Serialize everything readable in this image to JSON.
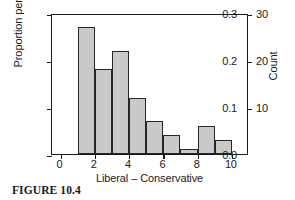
{
  "caption": "FIGURE 10.4",
  "chart_data": {
    "type": "bar",
    "title": "",
    "xlabel": "Liberal – Conservative",
    "ylabel": "Proportion per bar",
    "y2label": "Count",
    "grid": false,
    "legend": null,
    "xlim": [
      -0.5,
      11.0
    ],
    "ylim": [
      0.0,
      0.3
    ],
    "y2lim": [
      0,
      30
    ],
    "xticks": [
      "0",
      "2",
      "4",
      "6",
      "8",
      "10"
    ],
    "xtick_values": [
      0,
      2,
      4,
      6,
      8,
      10
    ],
    "yticks": [
      "0.0",
      "0.1",
      "0.2",
      "0.3"
    ],
    "ytick_values": [
      0.0,
      0.1,
      0.2,
      0.3
    ],
    "y2ticks": [
      "10",
      "20",
      "30"
    ],
    "y2tick_values": [
      10,
      20,
      30
    ],
    "bin_edges": [
      1,
      2,
      3,
      4,
      5,
      6,
      7,
      8,
      9,
      10
    ],
    "categories": [
      "1–2",
      "2–3",
      "3–4",
      "4–5",
      "5–6",
      "6–7",
      "7–8",
      "8–9",
      "9–10"
    ],
    "values": [
      0.27,
      0.18,
      0.22,
      0.12,
      0.07,
      0.04,
      0.01,
      0.06,
      0.03
    ],
    "counts": [
      27,
      18,
      22,
      12,
      7,
      4,
      1,
      6,
      3
    ],
    "bar_fill_color": "#c9c9c9",
    "bar_edge_color": "#262626",
    "axis_color": "#1a1a1a",
    "background_color": "#ffffff"
  }
}
